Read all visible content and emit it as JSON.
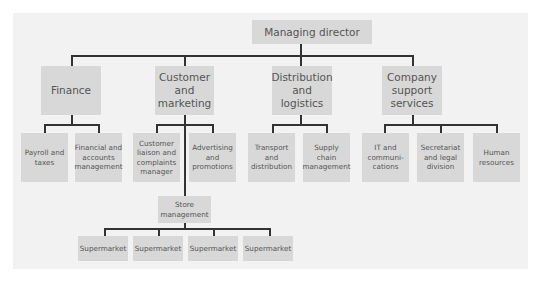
{
  "diagram": {
    "type": "organisation-chart",
    "root": {
      "label": "Managing director"
    },
    "departments": [
      {
        "label": "Finance",
        "children": [
          {
            "label": "Payroll and\ntaxes"
          },
          {
            "label": "Financial and\naccounts\nmanagement"
          }
        ]
      },
      {
        "label": "Customer\nand\nmarketing",
        "children": [
          {
            "label": "Customer\nliaison and\ncomplaints\nmanager"
          },
          {
            "label": "Advertising\nand\npromotions"
          }
        ],
        "sub_unit": {
          "label": "Store\nmanagement",
          "children": [
            {
              "label": "Supermarket"
            },
            {
              "label": "Supermarket"
            },
            {
              "label": "Supermarket"
            },
            {
              "label": "Supermarket"
            }
          ]
        }
      },
      {
        "label": "Distribution\nand\nlogistics",
        "children": [
          {
            "label": "Transport\nand\ndistribution"
          },
          {
            "label": "Supply\nchain\nmanagement"
          }
        ]
      },
      {
        "label": "Company\nsupport\nservices",
        "children": [
          {
            "label": "IT and\ncommuni-\ncations"
          },
          {
            "label": "Secretariat\nand legal\ndivision"
          },
          {
            "label": "Human\nresources"
          }
        ]
      }
    ],
    "colors": {
      "box_fill": "#d8d8d8",
      "panel": "#f2f2f2",
      "lines": "#333333",
      "text": "#555555"
    }
  }
}
